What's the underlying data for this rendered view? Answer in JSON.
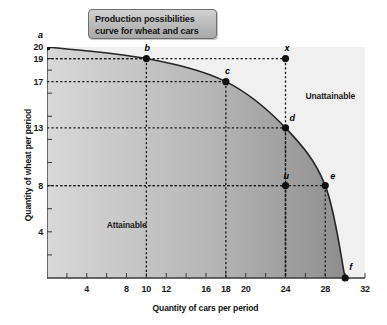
{
  "title": {
    "line1": "Production possibilities",
    "line2": "curve for wheat and cars"
  },
  "chart_data": {
    "type": "line",
    "title": "Production possibilities curve for wheat and cars",
    "xlabel": "Quantity of cars per period",
    "ylabel": "Quantity of wheat per period",
    "xlim": [
      0,
      32
    ],
    "ylim": [
      0,
      20
    ],
    "grid": false,
    "legend": null,
    "x_ticks_labeled": [
      4,
      8,
      10,
      12,
      16,
      18,
      20,
      24,
      28,
      32
    ],
    "x_tick_labels": [
      "4",
      "8",
      "10",
      "12",
      "16",
      "18",
      "20",
      "24",
      "28",
      "32"
    ],
    "x_ticks_minor": [
      2,
      4,
      6,
      8,
      10,
      12,
      14,
      16,
      18,
      20,
      22,
      24,
      26,
      28,
      30,
      32
    ],
    "y_ticks_labeled": [
      20,
      19,
      17,
      13,
      8,
      4
    ],
    "y_tick_labels": [
      "20",
      "19",
      "17",
      "13",
      "8",
      "4"
    ],
    "y_ticks_minor": [
      2,
      4,
      6,
      8,
      10,
      12,
      14,
      16,
      18,
      19,
      20
    ],
    "curve_name": "Production possibilities curve",
    "curve_points": [
      {
        "x": 0,
        "y": 20
      },
      {
        "x": 10,
        "y": 19
      },
      {
        "x": 18,
        "y": 17
      },
      {
        "x": 24,
        "y": 13
      },
      {
        "x": 28,
        "y": 8
      },
      {
        "x": 30,
        "y": 0
      }
    ],
    "points": [
      {
        "label": "a",
        "x": 0,
        "y": 20,
        "on_curve": true,
        "guides": []
      },
      {
        "label": "b",
        "x": 10,
        "y": 19,
        "on_curve": true,
        "guides": [
          "x",
          "y"
        ]
      },
      {
        "label": "c",
        "x": 18,
        "y": 17,
        "on_curve": true,
        "guides": [
          "x",
          "y"
        ]
      },
      {
        "label": "d",
        "x": 24,
        "y": 13,
        "on_curve": true,
        "guides": [
          "x",
          "y"
        ]
      },
      {
        "label": "e",
        "x": 28,
        "y": 8,
        "on_curve": true,
        "guides": [
          "x",
          "y"
        ]
      },
      {
        "label": "f",
        "x": 30,
        "y": 0,
        "on_curve": true,
        "guides": []
      },
      {
        "label": "x",
        "x": 24,
        "y": 19,
        "on_curve": false,
        "guides": [
          "x",
          "y"
        ]
      },
      {
        "label": "u",
        "x": 24,
        "y": 8,
        "on_curve": false,
        "guides": [
          "x",
          "y"
        ]
      }
    ],
    "regions": [
      {
        "label": "Attainable",
        "x": 6,
        "y": 5.0
      },
      {
        "label": "Unattainable",
        "x": 26,
        "y": 16.2
      }
    ],
    "colors": {
      "attainable_light": "#d8d8d8",
      "attainable_dark": "#8e8e8e",
      "unattainable": "#f0f0f0",
      "curve": "#262626",
      "point": "#101010",
      "guide": "#1a1a1a",
      "axis": "#3a3a3a",
      "title_box_border": "#6f6f6f"
    }
  }
}
